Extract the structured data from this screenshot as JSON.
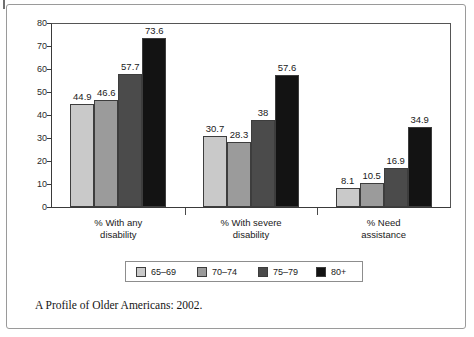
{
  "frame": {
    "corner_tick": "corner-tick-mark"
  },
  "caption": "A Profile of Older Americans: 2002.",
  "legend": {
    "entries": [
      {
        "label": "65–69",
        "color": "#c9c9c9"
      },
      {
        "label": "70–74",
        "color": "#9b9b9b"
      },
      {
        "label": "75–79",
        "color": "#4b4b4b"
      },
      {
        "label": "80+",
        "color": "#131313"
      }
    ]
  },
  "axis": {
    "y_ticks": [
      "80",
      "70",
      "60",
      "50",
      "40",
      "30",
      "20",
      "10",
      "0"
    ]
  },
  "chart_data": {
    "type": "bar",
    "title": "",
    "subtitle": "",
    "xlabel": "",
    "ylabel": "",
    "ylim": [
      0,
      80
    ],
    "y_tick_step": 10,
    "grid": false,
    "legend_position": "bottom",
    "categories": [
      "% With any disability",
      "% With severe disability",
      "% Need assistance"
    ],
    "category_lines": [
      [
        "% With any",
        "disability"
      ],
      [
        "% With severe",
        "disability"
      ],
      [
        "% Need",
        "assistance"
      ]
    ],
    "series": [
      {
        "name": "65–69",
        "color": "#c9c9c9",
        "values": [
          44.9,
          30.7,
          8.1
        ],
        "labels": [
          "44.9",
          "30.7",
          "8.1"
        ]
      },
      {
        "name": "70–74",
        "color": "#9b9b9b",
        "values": [
          46.6,
          28.3,
          10.5
        ],
        "labels": [
          "46.6",
          "28.3",
          "10.5"
        ]
      },
      {
        "name": "75–79",
        "color": "#4b4b4b",
        "values": [
          57.7,
          38.0,
          16.9
        ],
        "labels": [
          "57.7",
          "38",
          "16.9"
        ]
      },
      {
        "name": "80+",
        "color": "#131313",
        "values": [
          73.6,
          57.6,
          34.9
        ],
        "labels": [
          "73.6",
          "57.6",
          "34.9"
        ]
      }
    ],
    "source": "A Profile of Older Americans: 2002."
  }
}
